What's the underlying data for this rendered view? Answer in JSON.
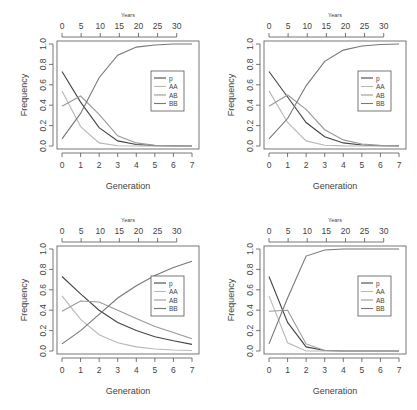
{
  "chart_data": [
    {
      "type": "line",
      "title": "",
      "xlabel": "Generation",
      "ylabel": "Frequency",
      "top_axis_label": "Years",
      "x_ticks": [
        0,
        1,
        2,
        3,
        4,
        5,
        6,
        7
      ],
      "top_ticks": [
        0,
        5,
        10,
        15,
        20,
        25,
        30
      ],
      "y_ticks": [
        "0.0",
        "0.2",
        "0.4",
        "0.6",
        "0.8",
        "1.0"
      ],
      "xlim": [
        0,
        7
      ],
      "ylim": [
        0,
        1
      ],
      "top_xlim": [
        0,
        34
      ],
      "legend": [
        "p",
        "AA",
        "AB",
        "BB"
      ],
      "legend_position": "right-middle",
      "x": [
        0,
        1,
        2,
        3,
        4,
        5,
        6,
        7
      ],
      "series": [
        {
          "name": "p",
          "values": [
            0.73,
            0.43,
            0.18,
            0.05,
            0.015,
            0.004,
            0.001,
            0.0
          ],
          "color": "#444444"
        },
        {
          "name": "AA",
          "values": [
            0.54,
            0.19,
            0.03,
            0.003,
            0.0,
            0.0,
            0.0,
            0.0
          ],
          "color": "#b8b8b8"
        },
        {
          "name": "AB",
          "values": [
            0.39,
            0.49,
            0.31,
            0.1,
            0.03,
            0.008,
            0.002,
            0.0
          ],
          "color": "#999999"
        },
        {
          "name": "BB",
          "values": [
            0.07,
            0.32,
            0.67,
            0.89,
            0.97,
            0.99,
            1.0,
            1.0
          ],
          "color": "#777777"
        }
      ]
    },
    {
      "type": "line",
      "title": "",
      "xlabel": "Generation",
      "ylabel": "Frequency",
      "top_axis_label": "Years",
      "x_ticks": [
        0,
        1,
        2,
        3,
        4,
        5,
        6,
        7
      ],
      "top_ticks": [
        0,
        5,
        10,
        15,
        20,
        25,
        30
      ],
      "y_ticks": [
        "0.0",
        "0.2",
        "0.4",
        "0.6",
        "0.8",
        "1.0"
      ],
      "xlim": [
        0,
        7
      ],
      "ylim": [
        0,
        1
      ],
      "top_xlim": [
        0,
        34
      ],
      "legend": [
        "p",
        "AA",
        "AB",
        "BB"
      ],
      "legend_position": "right-middle",
      "x": [
        0,
        1,
        2,
        3,
        4,
        5,
        6,
        7
      ],
      "series": [
        {
          "name": "p",
          "values": [
            0.73,
            0.48,
            0.23,
            0.09,
            0.03,
            0.01,
            0.003,
            0.001
          ],
          "color": "#444444"
        },
        {
          "name": "AA",
          "values": [
            0.54,
            0.23,
            0.05,
            0.008,
            0.001,
            0.0,
            0.0,
            0.0
          ],
          "color": "#b8b8b8"
        },
        {
          "name": "AB",
          "values": [
            0.39,
            0.5,
            0.36,
            0.16,
            0.06,
            0.02,
            0.006,
            0.002
          ],
          "color": "#999999"
        },
        {
          "name": "BB",
          "values": [
            0.07,
            0.27,
            0.59,
            0.83,
            0.94,
            0.98,
            0.995,
            1.0
          ],
          "color": "#777777"
        }
      ]
    },
    {
      "type": "line",
      "title": "",
      "xlabel": "Generation",
      "ylabel": "Frequency",
      "top_axis_label": "Years",
      "x_ticks": [
        0,
        1,
        2,
        3,
        4,
        5,
        6,
        7
      ],
      "top_ticks": [
        0,
        5,
        10,
        15,
        20,
        25,
        30
      ],
      "y_ticks": [
        "0.0",
        "0.2",
        "0.4",
        "0.6",
        "0.8",
        "1.0"
      ],
      "xlim": [
        0,
        7
      ],
      "ylim": [
        0,
        1
      ],
      "top_xlim": [
        0,
        34
      ],
      "legend": [
        "p",
        "AA",
        "AB",
        "BB"
      ],
      "legend_position": "right-middle",
      "x": [
        0,
        1,
        2,
        3,
        4,
        5,
        6,
        7
      ],
      "series": [
        {
          "name": "p",
          "values": [
            0.73,
            0.56,
            0.4,
            0.28,
            0.2,
            0.14,
            0.1,
            0.065
          ],
          "color": "#444444"
        },
        {
          "name": "AA",
          "values": [
            0.54,
            0.31,
            0.16,
            0.08,
            0.04,
            0.02,
            0.01,
            0.005
          ],
          "color": "#b8b8b8"
        },
        {
          "name": "AB",
          "values": [
            0.39,
            0.49,
            0.48,
            0.4,
            0.32,
            0.24,
            0.18,
            0.12
          ],
          "color": "#999999"
        },
        {
          "name": "BB",
          "values": [
            0.07,
            0.2,
            0.36,
            0.52,
            0.64,
            0.74,
            0.82,
            0.88
          ],
          "color": "#777777"
        }
      ]
    },
    {
      "type": "line",
      "title": "",
      "xlabel": "Generation",
      "ylabel": "Frequency",
      "top_axis_label": "Years",
      "x_ticks": [
        0,
        1,
        2,
        3,
        4,
        5,
        6,
        7
      ],
      "top_ticks": [
        0,
        5,
        10,
        15,
        20,
        25,
        30
      ],
      "y_ticks": [
        "0.0",
        "0.2",
        "0.4",
        "0.6",
        "0.8",
        "1.0"
      ],
      "xlim": [
        0,
        7
      ],
      "ylim": [
        0,
        1
      ],
      "top_xlim": [
        0,
        34
      ],
      "legend": [
        "p",
        "AA",
        "AB",
        "BB"
      ],
      "legend_position": "right-middle",
      "x": [
        0,
        1,
        2,
        3,
        4,
        5,
        6,
        7
      ],
      "series": [
        {
          "name": "p",
          "values": [
            0.73,
            0.28,
            0.04,
            0.005,
            0.0,
            0.0,
            0.0,
            0.0
          ],
          "color": "#444444"
        },
        {
          "name": "AA",
          "values": [
            0.54,
            0.08,
            0.0,
            0.0,
            0.0,
            0.0,
            0.0,
            0.0
          ],
          "color": "#b8b8b8"
        },
        {
          "name": "AB",
          "values": [
            0.39,
            0.4,
            0.07,
            0.005,
            0.0,
            0.0,
            0.0,
            0.0
          ],
          "color": "#999999"
        },
        {
          "name": "BB",
          "values": [
            0.07,
            0.52,
            0.93,
            0.99,
            1.0,
            1.0,
            1.0,
            1.0
          ],
          "color": "#777777"
        }
      ]
    }
  ]
}
